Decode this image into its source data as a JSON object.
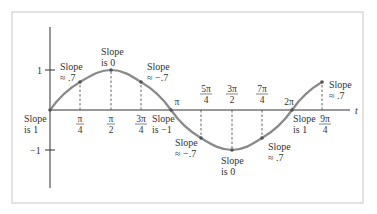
{
  "figure": {
    "axis_labels": {
      "x": "t",
      "y_pos": "1",
      "y_neg": "−1"
    },
    "ticks": [
      {
        "num": "π",
        "den": "4"
      },
      {
        "num": "π",
        "den": "2"
      },
      {
        "num": "3π",
        "den": "4"
      },
      {
        "single": "π"
      },
      {
        "num": "5π",
        "den": "4"
      },
      {
        "num": "3π",
        "den": "2"
      },
      {
        "num": "7π",
        "den": "4"
      },
      {
        "single": "2π"
      },
      {
        "num": "9π",
        "den": "4"
      }
    ],
    "slope_annotations": [
      {
        "at": "0",
        "line1": "Slope",
        "line2": "is 1"
      },
      {
        "at": "π/4",
        "line1": "Slope",
        "line2": "≈ .7"
      },
      {
        "at": "π/2",
        "line1": "Slope",
        "line2": "is 0"
      },
      {
        "at": "3π/4",
        "line1": "Slope",
        "line2": "≈ −.7"
      },
      {
        "at": "π",
        "line1": "Slope",
        "line2": "is −1"
      },
      {
        "at": "5π/4",
        "line1": "Slope",
        "line2": "≈ −.7"
      },
      {
        "at": "3π/2",
        "line1": "Slope",
        "line2": "is 0"
      },
      {
        "at": "7π/4",
        "line1": "Slope",
        "line2": "≈ .7"
      },
      {
        "at": "2π",
        "line1": "Slope",
        "line2": "is 1"
      },
      {
        "at": "9π/4",
        "line1": "Slope",
        "line2": "≈ .7"
      }
    ],
    "curve": {
      "function": "sin t",
      "domain": "0 to 9π/4",
      "color": "#8a8a8a"
    },
    "colors": {
      "axis": "#333333",
      "frame": "#cccccc",
      "text": "#333333",
      "dashed": "#555555"
    }
  }
}
